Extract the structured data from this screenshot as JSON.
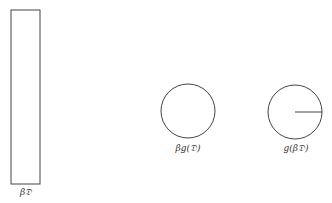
{
  "diagram": {
    "stroke_color": "#444444",
    "shapes": [
      {
        "id": "rect",
        "type": "rectangle",
        "label": "β𝔇"
      },
      {
        "id": "circle-middle",
        "type": "circle",
        "label": "βg(𝔇)"
      },
      {
        "id": "circle-right",
        "type": "circle-with-radius",
        "label": "g(β𝔇)"
      }
    ]
  }
}
